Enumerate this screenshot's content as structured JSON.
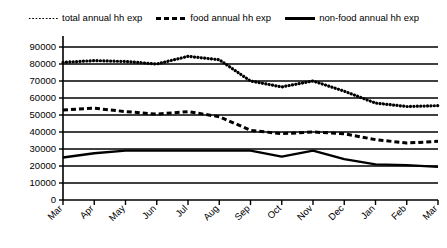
{
  "legend": {
    "items": [
      {
        "label": "total annual hh exp",
        "style": "dotted",
        "icon": "dotted-line-icon"
      },
      {
        "label": "food annual hh exp",
        "style": "dashed",
        "icon": "dashed-line-icon"
      },
      {
        "label": "non-food annual hh exp",
        "style": "solid",
        "icon": "solid-line-icon"
      }
    ]
  },
  "axes": {
    "ylabel": "",
    "xlabel": "",
    "yticks": [
      "0",
      "10000",
      "20000",
      "30000",
      "40000",
      "50000",
      "60000",
      "70000",
      "80000",
      "90000"
    ],
    "xticks": [
      "Mar",
      "Apr",
      "May",
      "Jun",
      "Jul",
      "Aug",
      "Sep",
      "Oct",
      "Nov",
      "Dec",
      "Jan",
      "Feb",
      "Mar"
    ]
  },
  "colors": {
    "line": "#000000",
    "grid": "#000000",
    "background": "#ffffff"
  },
  "chart_data": {
    "type": "line",
    "title": "",
    "subtitle": "",
    "xlabel": "",
    "ylabel": "",
    "ylim": [
      0,
      90000
    ],
    "ytick_step": 10000,
    "grid": true,
    "legend_position": "top",
    "categories": [
      "Mar",
      "Apr",
      "May",
      "Jun",
      "Jul",
      "Aug",
      "Sep",
      "Oct",
      "Nov",
      "Dec",
      "Jan",
      "Feb",
      "Mar"
    ],
    "series": [
      {
        "name": "total annual hh exp",
        "style": "dotted",
        "values": [
          81000,
          82000,
          81500,
          80000,
          84500,
          82500,
          70000,
          66500,
          70000,
          64000,
          57000,
          55000,
          55500
        ]
      },
      {
        "name": "food annual hh exp",
        "style": "dashed",
        "values": [
          53000,
          54000,
          52000,
          50500,
          52000,
          49000,
          41000,
          39000,
          40000,
          39000,
          35500,
          33500,
          34500
        ]
      },
      {
        "name": "non-food annual hh exp",
        "style": "solid",
        "values": [
          25000,
          27500,
          29000,
          29000,
          29000,
          29000,
          29000,
          25500,
          29000,
          24000,
          21000,
          20500,
          19500
        ]
      }
    ]
  }
}
